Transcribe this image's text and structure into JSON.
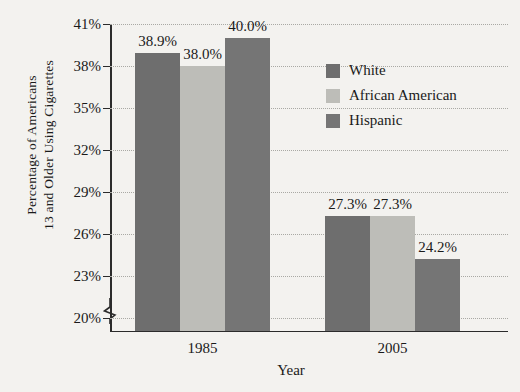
{
  "chart_data": {
    "type": "bar",
    "title": "",
    "xlabel": "Year",
    "ylabel_line1": "Percentage of Americans",
    "ylabel_line2": "13 and Older Using Cigarettes",
    "categories": [
      "1985",
      "2005"
    ],
    "series": [
      {
        "name": "White",
        "color": "#6e6e6e",
        "values": [
          38.9,
          27.3
        ],
        "labels": [
          "38.9%",
          "27.3%"
        ]
      },
      {
        "name": "African American",
        "color": "#bdbdb8",
        "values": [
          38.0,
          27.3
        ],
        "labels": [
          "38.0%",
          "27.3%"
        ]
      },
      {
        "name": "Hispanic",
        "color": "#757575",
        "values": [
          40.0,
          24.2
        ],
        "labels": [
          "40.0%",
          "24.2%"
        ]
      }
    ],
    "ylim": [
      19,
      41
    ],
    "yticks": [
      20,
      23,
      26,
      29,
      32,
      35,
      38,
      41
    ],
    "ytick_labels": [
      "20%",
      "23%",
      "26%",
      "29%",
      "32%",
      "35%",
      "38%",
      "41%"
    ],
    "grid": true,
    "axis_break": true,
    "legend_position": "inside-top-right",
    "background": "#f3f2ef"
  }
}
